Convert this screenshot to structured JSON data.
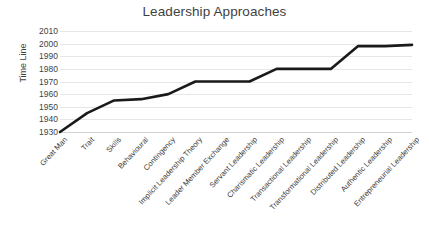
{
  "chart_data": {
    "type": "line",
    "title": "Leadership Approaches",
    "xlabel": "",
    "ylabel": "Time Line",
    "ylim": [
      1930,
      2010
    ],
    "ytick_step": 10,
    "grid": true,
    "legend": false,
    "legend_position": "none",
    "line_color": "#1a1a1a",
    "grid_color": "#e6e6e6",
    "background_color": "#ffffff",
    "yticks": [
      2010,
      2000,
      1990,
      1980,
      1970,
      1960,
      1950,
      1940,
      1930
    ],
    "categories": [
      "Great Man",
      "Trait",
      "Skills",
      "Behavioural",
      "Contingency",
      "Implicit Leadership Theory",
      "Leader Member Exchange",
      "Servant Leadership",
      "Charismatic Leadership",
      "Transactional Leadership",
      "Transformational Leadership",
      "Distributed Leadership",
      "Authentic Leadership",
      "Entrepreneurial Leadership"
    ],
    "values": [
      1930,
      1945,
      1955,
      1956,
      1960,
      1970,
      1970,
      1970,
      1980,
      1980,
      1980,
      1998,
      1998,
      1999
    ]
  }
}
